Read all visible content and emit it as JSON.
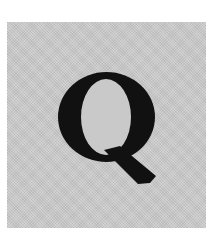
{
  "tile": {
    "letter": "Q",
    "background_color": "#c9c9c9",
    "letter_color": "#111111"
  }
}
